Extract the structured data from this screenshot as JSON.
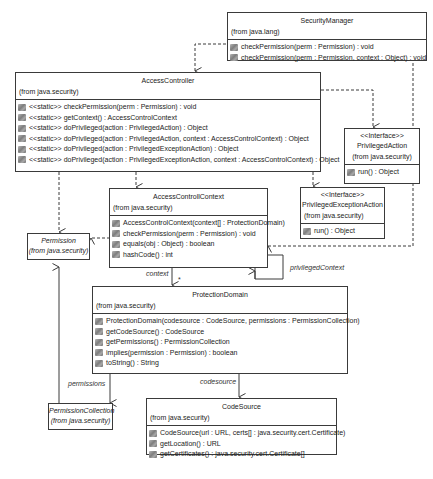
{
  "classes": {
    "security_manager": {
      "name": "SecurityManager",
      "from": "(from java.lang)",
      "ops": [
        {
          "icon": "method-icon",
          "text": "checkPermission(perm : Permission) : void"
        },
        {
          "icon": "method-icon",
          "text": "checkPermission(perm : Permission, context : Object) : void"
        }
      ]
    },
    "access_controller": {
      "name": "AccessController",
      "from": "(from java.security)",
      "ops": [
        {
          "icon": "method-icon",
          "text": "<<static>> checkPermission(perm : Permission) : void"
        },
        {
          "icon": "method-icon",
          "text": "<<static>> getContext() : AccessControlContext"
        },
        {
          "icon": "method-icon",
          "text": "<<static>> doPrivileged(action : PrivilegedAction) : Object"
        },
        {
          "icon": "method-icon",
          "text": "<<static>> doPrivileged(action : PrivilegedAction, context : AccessControlContext) : Object"
        },
        {
          "icon": "method-icon",
          "text": "<<static>> doPrivileged(action : PrivilegedExceptionAction) : Object"
        },
        {
          "icon": "method-icon",
          "text": "<<static>> doPrivileged(action : PrivilegedExceptionAction, context : AccessControlContext) : Object"
        }
      ]
    },
    "privileged_action": {
      "stereotype": "<<Interface>>",
      "name": "PrivilegedAction",
      "from": "(from java.security)",
      "ops": [
        {
          "icon": "method-icon",
          "text": "run() : Object"
        }
      ]
    },
    "access_control_context": {
      "name": "AccessControllContext",
      "from": "(from java.security)",
      "ops": [
        {
          "icon": "method-icon",
          "text": "AccessControlContext(context[] : ProtectionDomain)"
        },
        {
          "icon": "method-icon",
          "text": "checkPermission(perm : Permission) : void"
        },
        {
          "icon": "method-icon",
          "text": "equals(obj : Object) : boolean"
        },
        {
          "icon": "method-icon",
          "text": "hashCode() : int"
        }
      ]
    },
    "privileged_exception_action": {
      "stereotype": "<<Interface>>",
      "name": "PrivilegedExceptionAction",
      "from": "(from java.security)",
      "ops": [
        {
          "icon": "method-icon",
          "text": "run() : Object"
        }
      ]
    },
    "permission": {
      "name": "Permission",
      "from": "(from java.security)"
    },
    "protection_domain": {
      "name": "ProtectionDomain",
      "from": "(from java.security)",
      "ops": [
        {
          "icon": "method-icon",
          "text": "ProtectionDomain(codesource : CodeSource, permissions : PermissionCollection)"
        },
        {
          "icon": "method-icon",
          "text": "getCodeSource() : CodeSource"
        },
        {
          "icon": "method-icon",
          "text": "getPermissions() : PermissionCollection"
        },
        {
          "icon": "method-icon",
          "text": "implies(permission : Permission) : boolean"
        },
        {
          "icon": "method-icon",
          "text": "toString() : String"
        }
      ]
    },
    "permission_collection": {
      "name": "PermissionCollection",
      "from": "(from java.security)"
    },
    "code_source": {
      "name": "CodeSource",
      "from": "(from java.security)",
      "ops": [
        {
          "icon": "method-icon",
          "text": "CodeSource(url : URL, certs[] : java.security.cert.Certificate)"
        },
        {
          "icon": "method-icon",
          "text": "getLocation() : URL"
        },
        {
          "icon": "method-icon",
          "text": "getCertificates() : java.security.cert.Certificate[]"
        }
      ]
    }
  },
  "labels": {
    "context": "context",
    "multiplicity": "*",
    "privileged_context": "privilegedContext",
    "permissions": "permissions",
    "codesource": "codesource"
  },
  "colors": {
    "line": "#3a3a3a",
    "background": "#ffffff"
  }
}
